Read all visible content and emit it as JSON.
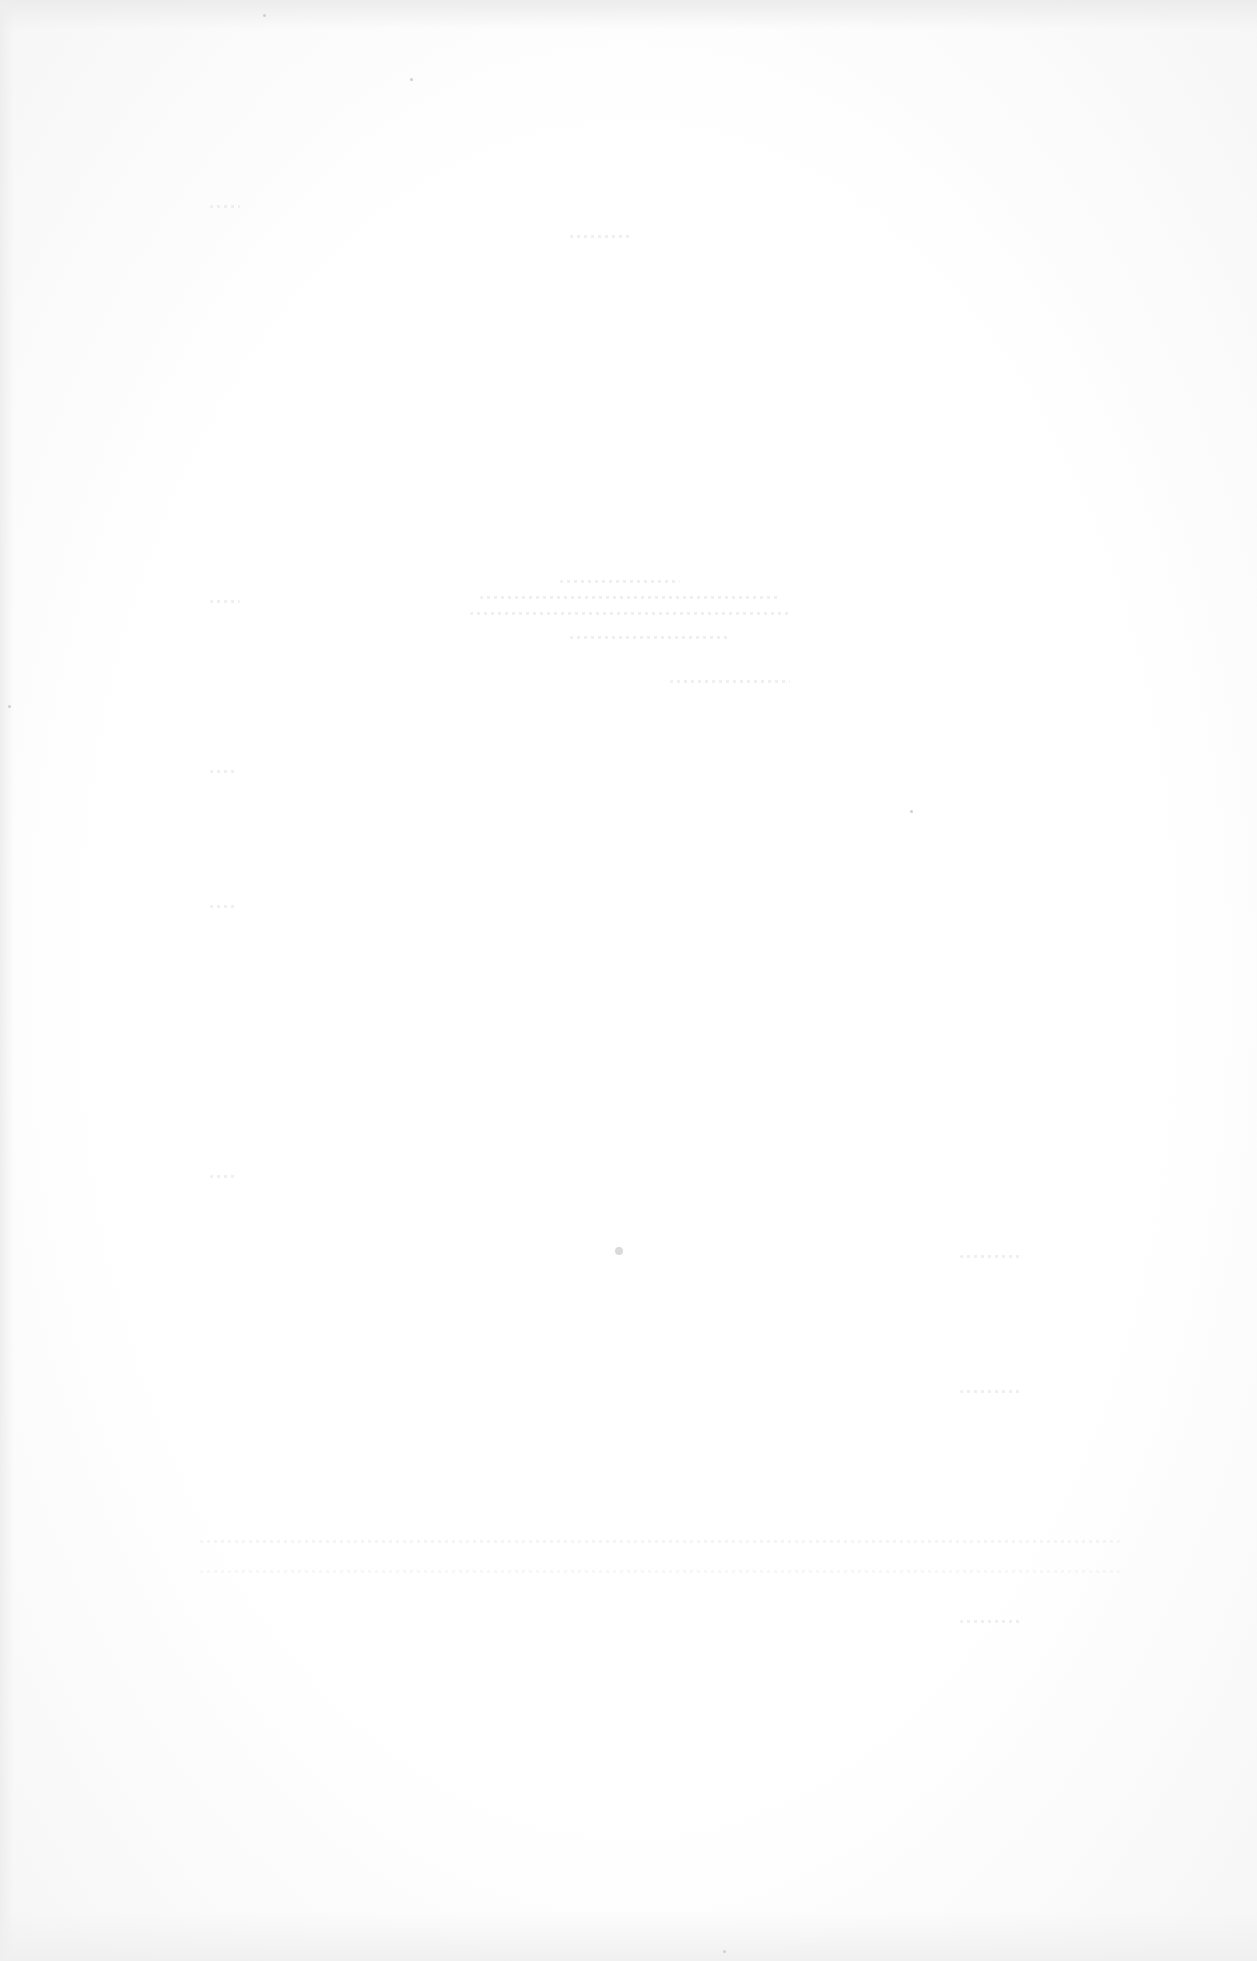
{
  "document": {
    "type": "scanned-page",
    "content_legible": false,
    "background_color": "#ffffff",
    "bleed_through_color": "#e9e9e9"
  }
}
